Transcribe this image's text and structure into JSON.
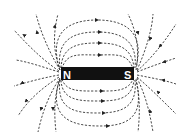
{
  "diagram": {
    "magnet": {
      "north_label": "N",
      "south_label": "S",
      "color": "#111111",
      "label_color": "#ffffff"
    },
    "field_lines": {
      "style": "dashed",
      "color": "#333333",
      "direction": "N to S (outside magnet)",
      "top_arcs": 4,
      "bottom_arcs": 4,
      "radial_lines_left": 8,
      "radial_lines_right": 8
    },
    "background": "#ffffff"
  }
}
